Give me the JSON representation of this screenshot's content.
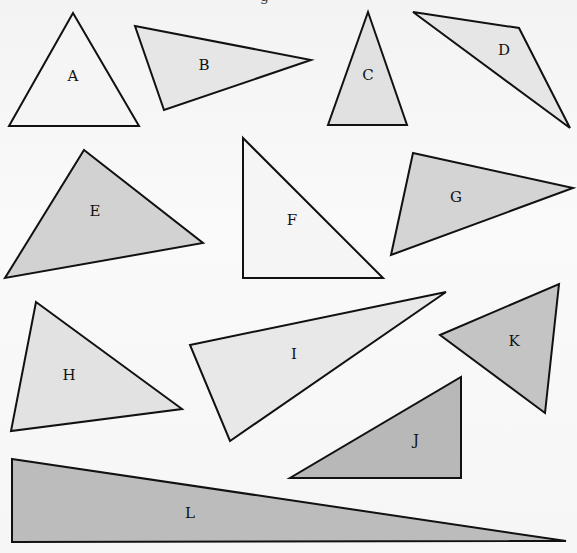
{
  "figure": {
    "width": 577,
    "height": 553,
    "top_fragment": "g",
    "triangles": [
      {
        "label": "A",
        "points": "73,13 139,126 9,126",
        "label_pos": [
          73,
          77
        ],
        "fill": "#f5f5f5"
      },
      {
        "label": "B",
        "points": "135,26 311,60 164,110",
        "label_pos": [
          204,
          66
        ],
        "fill": "#e6e6e6"
      },
      {
        "label": "C",
        "points": "368,12 407,125 328,125",
        "label_pos": [
          368,
          76
        ],
        "fill": "#e1e1e1"
      },
      {
        "label": "D",
        "points": "413,12 519,28 570,128",
        "label_pos": [
          504,
          51
        ],
        "fill": "#e6e6e6"
      },
      {
        "label": "E",
        "points": "84,150 203,243 5,278",
        "label_pos": [
          95,
          212
        ],
        "fill": "#d2d2d2"
      },
      {
        "label": "F",
        "points": "243,138 383,278 243,278",
        "label_pos": [
          292,
          221
        ],
        "fill": "#f5f5f5"
      },
      {
        "label": "G",
        "points": "413,153 573,188 391,255",
        "label_pos": [
          456,
          198
        ],
        "fill": "#d4d4d4"
      },
      {
        "label": "H",
        "points": "36,302 182,409 11,431",
        "label_pos": [
          69,
          376
        ],
        "fill": "#e2e2e2"
      },
      {
        "label": "I",
        "points": "190,345 446,292 230,441",
        "label_pos": [
          294,
          355
        ],
        "fill": "#e8e8e8"
      },
      {
        "label": "J",
        "points": "461,377 461,478 290,478",
        "label_pos": [
          416,
          441
        ],
        "fill": "#b8b8b8"
      },
      {
        "label": "K",
        "points": "440,335 559,284 545,413",
        "label_pos": [
          514,
          342
        ],
        "fill": "#c4c4c4"
      },
      {
        "label": "L",
        "points": "12,459 566,541 12,542",
        "label_pos": [
          190,
          514
        ],
        "fill": "#bcbcbc"
      }
    ]
  }
}
